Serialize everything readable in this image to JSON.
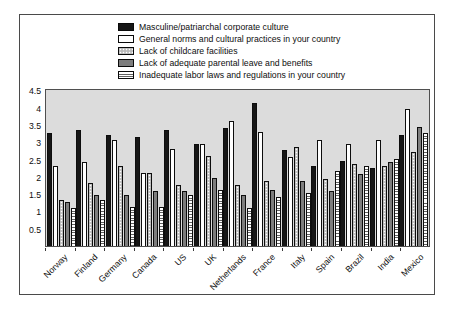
{
  "chart_data": {
    "type": "bar",
    "title": "",
    "xlabel": "",
    "ylabel": "",
    "grid": false,
    "legend_position": "top-left",
    "plot_background": "#dcdcdc",
    "ylim": [
      0,
      4.5
    ],
    "y_ticks": [
      0.5,
      1,
      1.5,
      2,
      2.5,
      3,
      3.5,
      4,
      4.5
    ],
    "categories": [
      "Norway",
      "Finland",
      "Germany",
      "Canada",
      "US",
      "UK",
      "Netherlands",
      "France",
      "Italy",
      "Spain",
      "Brazil",
      "India",
      "Mexico"
    ],
    "series": [
      {
        "name": "Masculine/patriarchal corporate culture",
        "pattern": "solid-black",
        "color": "#161616",
        "values": [
          3.3,
          3.4,
          3.25,
          3.2,
          3.4,
          3.0,
          3.45,
          4.2,
          2.8,
          2.35,
          2.5,
          2.3,
          3.25
        ]
      },
      {
        "name": "General norms and cultural practices in your country",
        "pattern": "solid-white",
        "color": "#ffffff",
        "values": [
          2.35,
          2.45,
          3.1,
          2.15,
          2.85,
          3.0,
          3.65,
          3.35,
          2.6,
          3.1,
          3.0,
          3.1,
          4.0
        ]
      },
      {
        "name": "Lack of childcare facilities",
        "pattern": "dotted-light-gray",
        "color": "#c6c6c6",
        "values": [
          1.35,
          1.85,
          2.35,
          2.15,
          1.8,
          2.65,
          1.8,
          1.9,
          2.9,
          1.95,
          2.4,
          2.35,
          2.75
        ]
      },
      {
        "name": "Lack of adequate parental leave and benefits",
        "pattern": "solid-gray",
        "color": "#7d7d7d",
        "values": [
          1.3,
          1.5,
          1.5,
          1.6,
          1.6,
          2.0,
          1.5,
          1.65,
          1.9,
          1.6,
          2.1,
          2.45,
          3.5
        ]
      },
      {
        "name": "Inadequate labor laws and regulations in your country",
        "pattern": "horizontal-stripes",
        "color": "#ffffff",
        "values": [
          1.1,
          1.35,
          1.15,
          1.15,
          1.5,
          1.65,
          1.1,
          1.45,
          1.55,
          2.2,
          2.35,
          2.55,
          3.3
        ]
      }
    ]
  }
}
